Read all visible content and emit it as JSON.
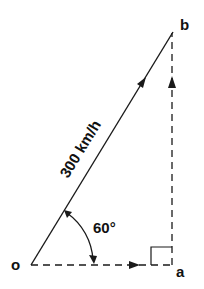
{
  "diagram": {
    "points": {
      "o": {
        "label": "o",
        "x": 31,
        "y": 265
      },
      "a": {
        "label": "a",
        "x": 172,
        "y": 265
      },
      "b": {
        "label": "b",
        "x": 173,
        "y": 32
      }
    },
    "vectors": [
      {
        "from": "o",
        "to": "b",
        "style": "solid",
        "label": "300 km/h"
      },
      {
        "from": "o",
        "to": "a",
        "style": "dashed",
        "label": ""
      },
      {
        "from": "a",
        "to": "b",
        "style": "dashed",
        "label": ""
      }
    ],
    "angle": {
      "label": "60°",
      "at": "o",
      "between": [
        "oa",
        "ob"
      ]
    },
    "right_angle": {
      "at": "a"
    },
    "colors": {
      "stroke": "#1a1a1a",
      "background": "#ffffff"
    }
  }
}
